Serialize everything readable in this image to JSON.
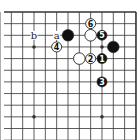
{
  "diagram": {
    "type": "go-board-fragment",
    "corner": "top-right",
    "grid": {
      "first_col": 6,
      "last_col": 18,
      "first_row": 0,
      "last_row": 11,
      "edges": [
        "top",
        "right"
      ],
      "star_points": [
        [
          9,
          3
        ],
        [
          15,
          3
        ],
        [
          9,
          9
        ],
        [
          15,
          9
        ]
      ]
    },
    "colors": {
      "background": "#ffffff",
      "line": "#333333",
      "black_stone": "#111111",
      "white_stone": "#ffffff",
      "stone_outline": "#222222"
    },
    "stones": [
      {
        "color": "black",
        "col": 12,
        "row": 2,
        "label": ""
      },
      {
        "color": "white",
        "col": 14,
        "row": 1,
        "label": "6"
      },
      {
        "color": "white",
        "col": 14,
        "row": 2,
        "label": ""
      },
      {
        "color": "black",
        "col": 15,
        "row": 2,
        "label": "5"
      },
      {
        "color": "black",
        "col": 16,
        "row": 3,
        "label": ""
      },
      {
        "color": "white",
        "col": 11,
        "row": 3,
        "label": "4"
      },
      {
        "color": "white",
        "col": 13,
        "row": 4,
        "label": ""
      },
      {
        "color": "white",
        "col": 14,
        "row": 4,
        "label": "2"
      },
      {
        "color": "black",
        "col": 15,
        "row": 4,
        "label": "1"
      },
      {
        "color": "black",
        "col": 15,
        "row": 6,
        "label": "3"
      }
    ],
    "marks": [
      {
        "text": "b",
        "col": 9,
        "row": 2
      },
      {
        "text": "a",
        "col": 11,
        "row": 2
      }
    ]
  }
}
